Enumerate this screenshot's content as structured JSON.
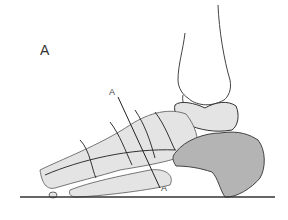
{
  "figure": {
    "panel_label": "A",
    "section_line": {
      "top_label": "A",
      "bottom_label": "A"
    },
    "colors": {
      "bone_fill": "#e4e4e4",
      "calcaneus_fill": "#b4b4b4",
      "outline": "#333333",
      "ground_line": "#333333",
      "background": "#ffffff"
    }
  }
}
